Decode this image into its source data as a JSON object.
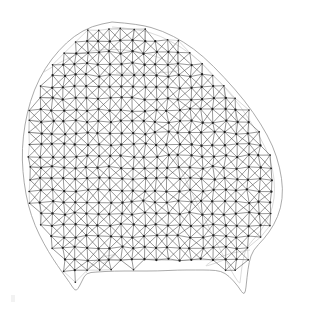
{
  "figure": {
    "kind": "wireframe-mesh",
    "background_color": "#ffffff",
    "line_color": "#575757",
    "back_line_color": "#b9b9b9",
    "node_color": "#1d1d1d",
    "outline_color": "#8d8d8d",
    "rim_color": "#c2c2c2",
    "canvas": {
      "width": 309,
      "height": 318
    },
    "element_type": "triangle",
    "mesh_pattern": "quad-grid-with-crossed-diagonals",
    "grid_spacing_px": 11.5,
    "node_radius_px": 1.15,
    "shading": "none",
    "projection": "perspective-3d-shell",
    "rim_offset_px": 5.0,
    "node_jitter_px": 1.35,
    "random_seed": 20240731,
    "silhouette_label": "blob with two lower protrusions and a central notch",
    "outline_points": [
      [
        112,
        22
      ],
      [
        139,
        24
      ],
      [
        163,
        31
      ],
      [
        184,
        42
      ],
      [
        203,
        56
      ],
      [
        224,
        77
      ],
      [
        245,
        101
      ],
      [
        261,
        124
      ],
      [
        273,
        146
      ],
      [
        280,
        168
      ],
      [
        283,
        189
      ],
      [
        281,
        208
      ],
      [
        274,
        225
      ],
      [
        264,
        239
      ],
      [
        253,
        250
      ],
      [
        249,
        262
      ],
      [
        247,
        277
      ],
      [
        245,
        297
      ],
      [
        238,
        286
      ],
      [
        229,
        276
      ],
      [
        221,
        271
      ],
      [
        210,
        270
      ],
      [
        196,
        270
      ],
      [
        178,
        270
      ],
      [
        158,
        271
      ],
      [
        136,
        271
      ],
      [
        114,
        271
      ],
      [
        96,
        272
      ],
      [
        86,
        273
      ],
      [
        82,
        281
      ],
      [
        78,
        289
      ],
      [
        75,
        291
      ],
      [
        70,
        283
      ],
      [
        62,
        272
      ],
      [
        53,
        259
      ],
      [
        44,
        244
      ],
      [
        35,
        226
      ],
      [
        28,
        205
      ],
      [
        24,
        183
      ],
      [
        22,
        160
      ],
      [
        23,
        137
      ],
      [
        27,
        113
      ],
      [
        34,
        90
      ],
      [
        45,
        68
      ],
      [
        59,
        50
      ],
      [
        74,
        36
      ],
      [
        92,
        26
      ]
    ],
    "rim_points": [
      [
        112,
        27
      ],
      [
        138,
        29
      ],
      [
        161,
        36
      ],
      [
        181,
        47
      ],
      [
        199,
        60
      ],
      [
        219,
        81
      ],
      [
        239,
        104
      ],
      [
        254,
        127
      ],
      [
        266,
        148
      ],
      [
        273,
        169
      ],
      [
        275,
        189
      ],
      [
        273,
        207
      ],
      [
        266,
        223
      ],
      [
        257,
        236
      ],
      [
        247,
        246
      ],
      [
        243,
        259
      ],
      [
        241,
        274
      ],
      [
        239,
        291
      ]
    ],
    "interior_fold_points": [
      [
        44,
        72
      ],
      [
        66,
        58
      ],
      [
        92,
        50
      ],
      [
        120,
        49
      ],
      [
        148,
        53
      ],
      [
        170,
        62
      ],
      [
        188,
        74
      ]
    ],
    "notch_fold_points": [
      [
        86,
        273
      ],
      [
        92,
        262
      ],
      [
        104,
        256
      ],
      [
        120,
        254
      ]
    ],
    "right_fold_points": [
      [
        250,
        250
      ],
      [
        236,
        252
      ],
      [
        222,
        256
      ],
      [
        210,
        262
      ],
      [
        203,
        268
      ]
    ]
  },
  "annotations": {
    "corner_mark": {
      "label": "faint-artifact-mark",
      "x": 11,
      "y": 295,
      "w": 4,
      "h": 7
    }
  },
  "accessible": {
    "description": "A dense gray triangulated surface mesh forming a rounded blob shape with a flat lower edge and two pointed protrusions at the bottom, with dark dots marking mesh nodes."
  }
}
